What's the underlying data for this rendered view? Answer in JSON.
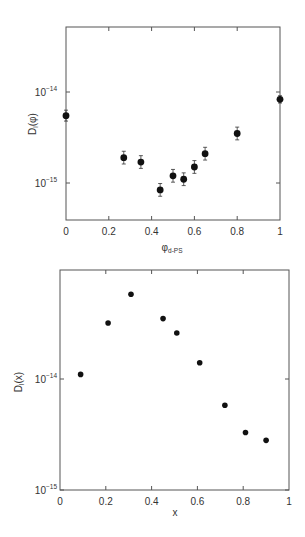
{
  "chart_data": [
    {
      "type": "scatter",
      "title": "",
      "xlabel": "φ",
      "xlabel_sub": "d-PS",
      "ylabel": "D",
      "ylabel_sub": "l",
      "ylabel_arg": "(φ)",
      "yscale": "log",
      "xlim": [
        0,
        1
      ],
      "ylim_log10": [
        -15.4,
        -13.7
      ],
      "x_ticks": [
        "0",
        "0.2",
        "0.4",
        "0.6",
        "0.8",
        "1"
      ],
      "x_tick_values": [
        0,
        0.2,
        0.4,
        0.6,
        0.8,
        1
      ],
      "y_ticks": [
        {
          "base": "10",
          "exp": "−14",
          "value": 1e-14
        },
        {
          "base": "10",
          "exp": "−15",
          "value": 1e-15
        }
      ],
      "error_bars": true,
      "grid": false,
      "points": [
        {
          "x": 0.0,
          "y": 5.5e-15,
          "err": 0.06
        },
        {
          "x": 0.27,
          "y": 1.9e-15,
          "err": 0.07
        },
        {
          "x": 0.35,
          "y": 1.7e-15,
          "err": 0.07
        },
        {
          "x": 0.44,
          "y": 8.4e-16,
          "err": 0.07
        },
        {
          "x": 0.5,
          "y": 1.2e-15,
          "err": 0.07
        },
        {
          "x": 0.55,
          "y": 1.1e-15,
          "err": 0.07
        },
        {
          "x": 0.6,
          "y": 1.5e-15,
          "err": 0.07
        },
        {
          "x": 0.65,
          "y": 2.1e-15,
          "err": 0.07
        },
        {
          "x": 0.8,
          "y": 3.5e-15,
          "err": 0.07
        },
        {
          "x": 1.0,
          "y": 8.3e-15,
          "err": 0.04
        }
      ]
    },
    {
      "type": "scatter",
      "title": "",
      "xlabel": "x",
      "ylabel": "D",
      "ylabel_sub": "l",
      "ylabel_arg": "(x)",
      "yscale": "log",
      "xlim": [
        0,
        1
      ],
      "ylim_log10": [
        -15,
        -13
      ],
      "x_ticks": [
        "0",
        "0.2",
        "0.4",
        "0.6",
        "0.8",
        "1"
      ],
      "x_tick_values": [
        0,
        0.2,
        0.4,
        0.6,
        0.8,
        1
      ],
      "y_ticks": [
        {
          "base": "10",
          "exp": "−14",
          "value": 1e-14
        },
        {
          "base": "10",
          "exp": "−15",
          "value": 1e-15
        }
      ],
      "error_bars": false,
      "grid": false,
      "points": [
        {
          "x": 0.09,
          "y": 1.1e-14
        },
        {
          "x": 0.21,
          "y": 3.2e-14
        },
        {
          "x": 0.31,
          "y": 5.8e-14
        },
        {
          "x": 0.45,
          "y": 3.5e-14
        },
        {
          "x": 0.51,
          "y": 2.6e-14
        },
        {
          "x": 0.61,
          "y": 1.4e-14
        },
        {
          "x": 0.72,
          "y": 5.8e-15
        },
        {
          "x": 0.81,
          "y": 3.3e-15
        },
        {
          "x": 0.9,
          "y": 2.8e-15
        }
      ]
    }
  ]
}
